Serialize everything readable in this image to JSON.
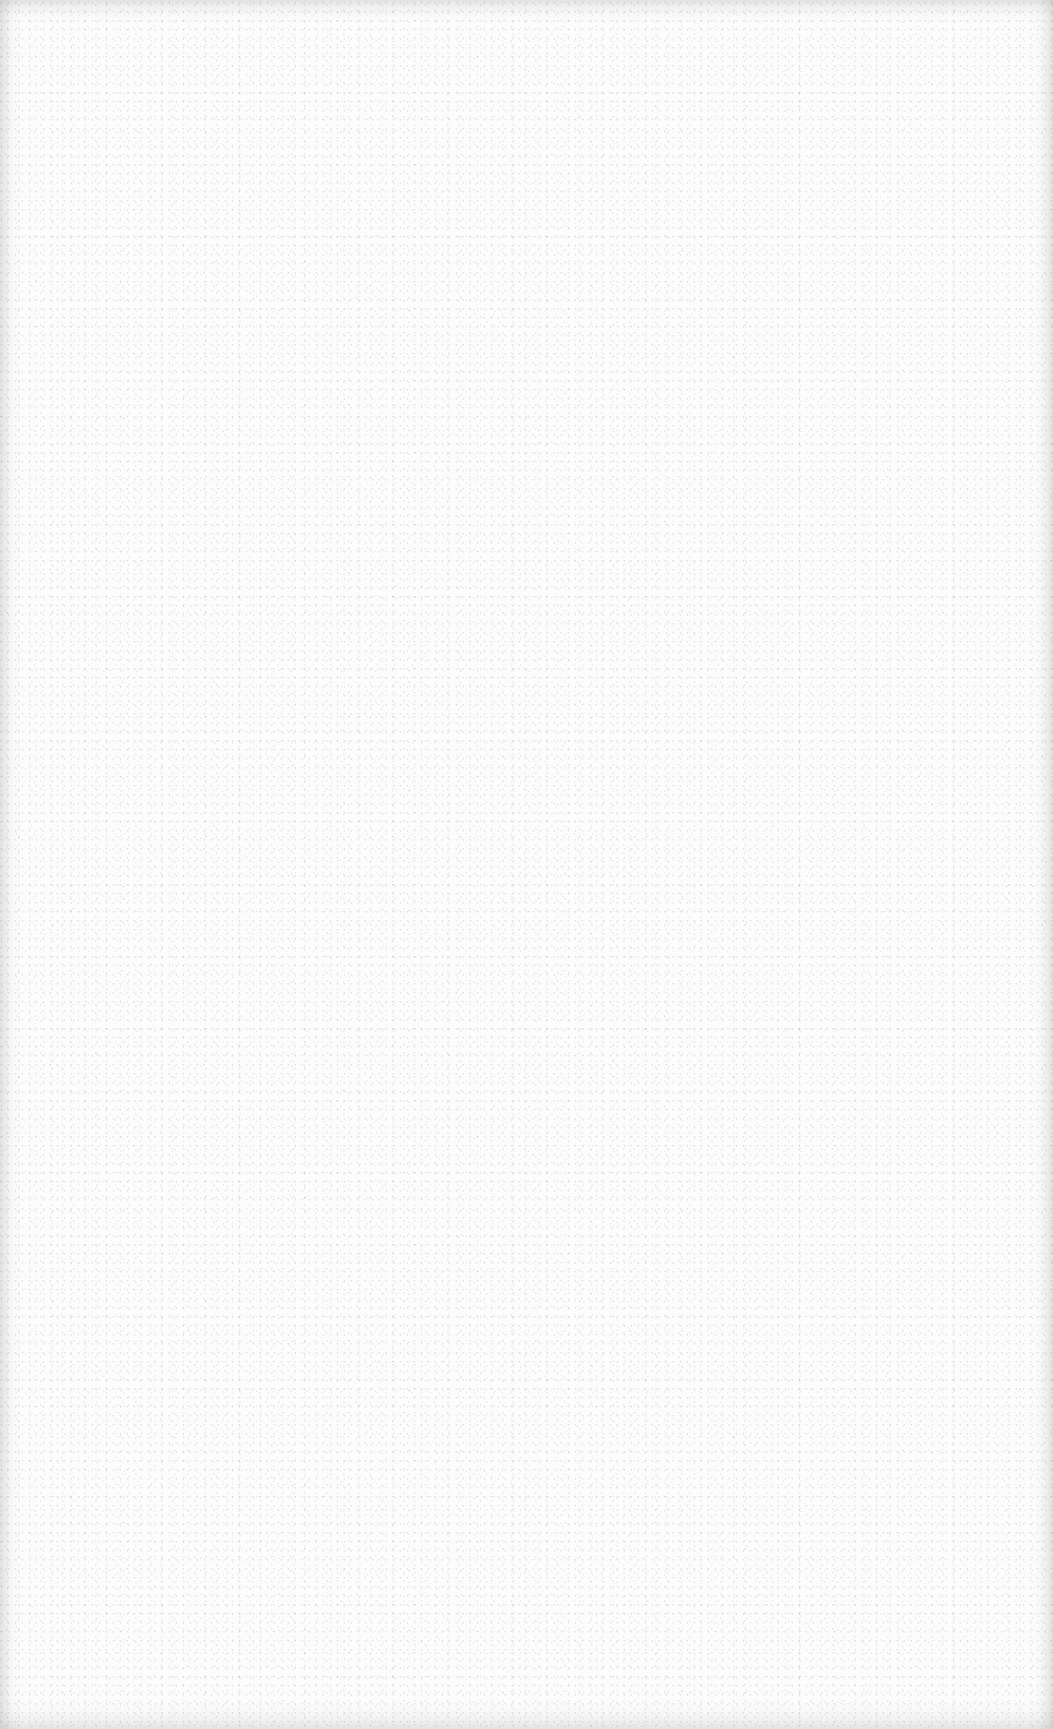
{
  "page": {
    "type": "blank-scanned-page",
    "background_color": "#fcfcfc",
    "content": []
  }
}
